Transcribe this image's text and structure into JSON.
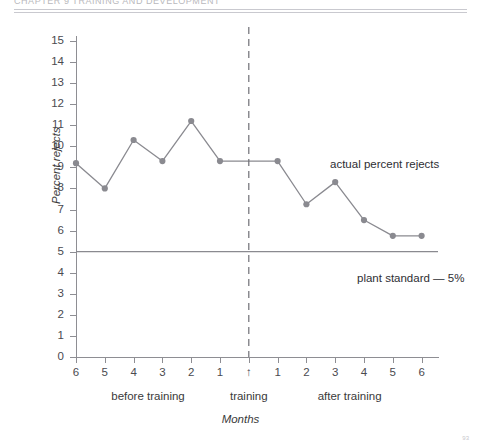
{
  "header": {
    "running_head": "CHAPTER 9 TRAINING AND DEVELOPMENT",
    "page_number": "93"
  },
  "chart_data": {
    "type": "line",
    "title": "",
    "xlabel": "Months",
    "ylabel": "Percent rejects",
    "ylim": [
      0,
      15
    ],
    "ytick_labels": [
      "0",
      "1",
      "2",
      "3",
      "4",
      "5",
      "6",
      "7",
      "8",
      "9",
      "10",
      "11",
      "12",
      "13",
      "14",
      "15"
    ],
    "xtick_labels": [
      "6",
      "5",
      "4",
      "3",
      "2",
      "1",
      "↑",
      "1",
      "2",
      "3",
      "4",
      "5",
      "6"
    ],
    "grid": false,
    "legend": "none",
    "categories": [
      "6",
      "5",
      "4",
      "3",
      "2",
      "1",
      "training",
      "1",
      "2",
      "3",
      "4",
      "5",
      "6"
    ],
    "series": [
      {
        "name": "actual percent rejects",
        "color": "#8a8a90",
        "values": [
          9.2,
          8.0,
          10.3,
          9.3,
          11.2,
          9.3,
          9.3,
          9.3,
          7.25,
          8.3,
          6.5,
          5.75,
          5.75
        ]
      }
    ],
    "reference_line": {
      "label": "plant standard — 5%",
      "value": 5,
      "color": "#8a8a90"
    },
    "divider": {
      "label": "training",
      "at_category": "training",
      "style": "dashed",
      "color": "#6f6f75"
    },
    "annotations": [
      {
        "text": "actual percent rejects"
      },
      {
        "text": "plant standard — 5%"
      }
    ],
    "region_labels": [
      {
        "text": "before training"
      },
      {
        "text": "training"
      },
      {
        "text": "after training"
      }
    ]
  }
}
